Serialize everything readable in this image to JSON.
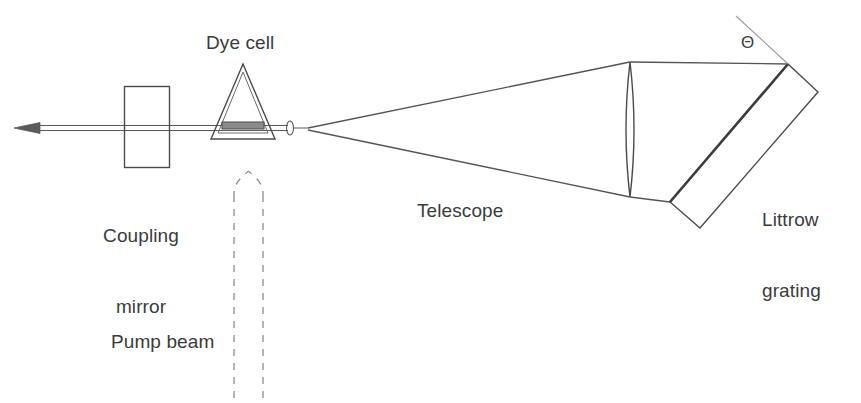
{
  "figure": {
    "width": 861,
    "height": 403,
    "background_color": "#ffffff",
    "line_color": "#4a4a4a",
    "text_color": "#3b3b3b"
  },
  "labels": {
    "dye_cell": "Dye cell",
    "coupling_mirror": "Coupling\nmirror",
    "coupling_mirror_line1": "Coupling",
    "coupling_mirror_line2": "mirror",
    "pump_beam": "Pump beam",
    "telescope": "Telescope",
    "littrow_grating": "Littrow\ngrating",
    "littrow_grating_line1": "Littrow",
    "littrow_grating_line2": "grating",
    "theta_symbol": "Θ"
  },
  "components": [
    {
      "name": "output-beam",
      "label": "Output laser beam",
      "description": "Horizontal thin beam exiting left with arrowhead"
    },
    {
      "name": "coupling-mirror",
      "label": "Coupling mirror",
      "description": "Vertical rectangle straddling the cavity axis"
    },
    {
      "name": "dye-cell",
      "label": "Dye cell",
      "description": "Triangular prism cell with active medium bar on the axis"
    },
    {
      "name": "pump-beam",
      "label": "Pump beam",
      "description": "Dashed upward arrow entering the dye cell from below"
    },
    {
      "name": "telescope",
      "label": "Telescope",
      "description": "Beam expander: focal point on left, lens on right"
    },
    {
      "name": "littrow-grating",
      "label": "Littrow grating",
      "description": "Tilted reflective grating at angle Theta to the beam"
    },
    {
      "name": "grating-normal",
      "label": "Grating normal",
      "description": "Thin construction line marking the grating normal"
    }
  ],
  "annotations": {
    "angle_symbol": "Θ",
    "angle_meaning": "Angle between incident beam and Littrow grating"
  }
}
